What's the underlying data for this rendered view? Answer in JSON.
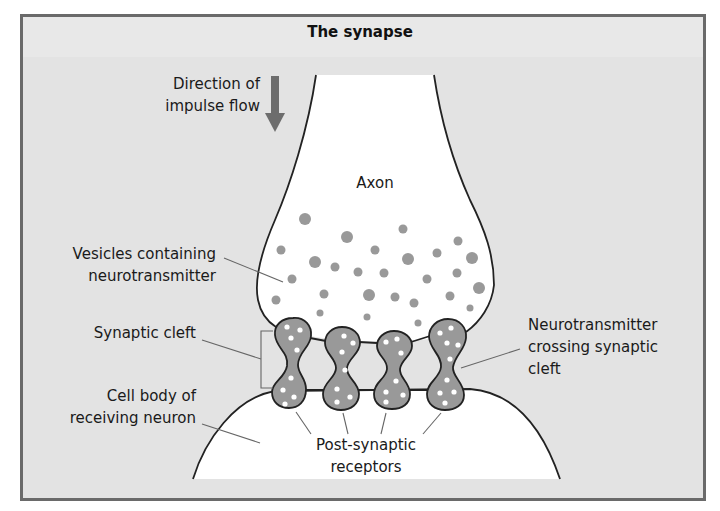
{
  "figure": {
    "title": "The synapse",
    "colors": {
      "frame_border": "#6a6a6a",
      "background": "#e3e3e3",
      "cell_fill": "#ffffff",
      "outline": "#222222",
      "vesicle_fill": "#999999",
      "neurotransmitter_dot": "#ffffff",
      "arrow": "#6d6d6d",
      "leader_line": "#666666"
    }
  },
  "labels": {
    "direction": {
      "line1": "Direction of",
      "line2": "impulse flow"
    },
    "axon": "Axon",
    "vesicles": {
      "line1": "Vesicles containing",
      "line2": "neurotransmitter"
    },
    "synaptic_cleft": "Synaptic cleft",
    "cell_body": {
      "line1": "Cell body of",
      "line2": "receiving neuron"
    },
    "post_synaptic": {
      "line1": "Post-synaptic",
      "line2": "receptors"
    },
    "crossing": {
      "line1": "Neurotransmitter",
      "line2": "crossing synaptic",
      "line3": "cleft"
    }
  },
  "structures": {
    "vesicle_count": 27,
    "synaptic_knob_count": 4,
    "arrow_direction": "down"
  }
}
